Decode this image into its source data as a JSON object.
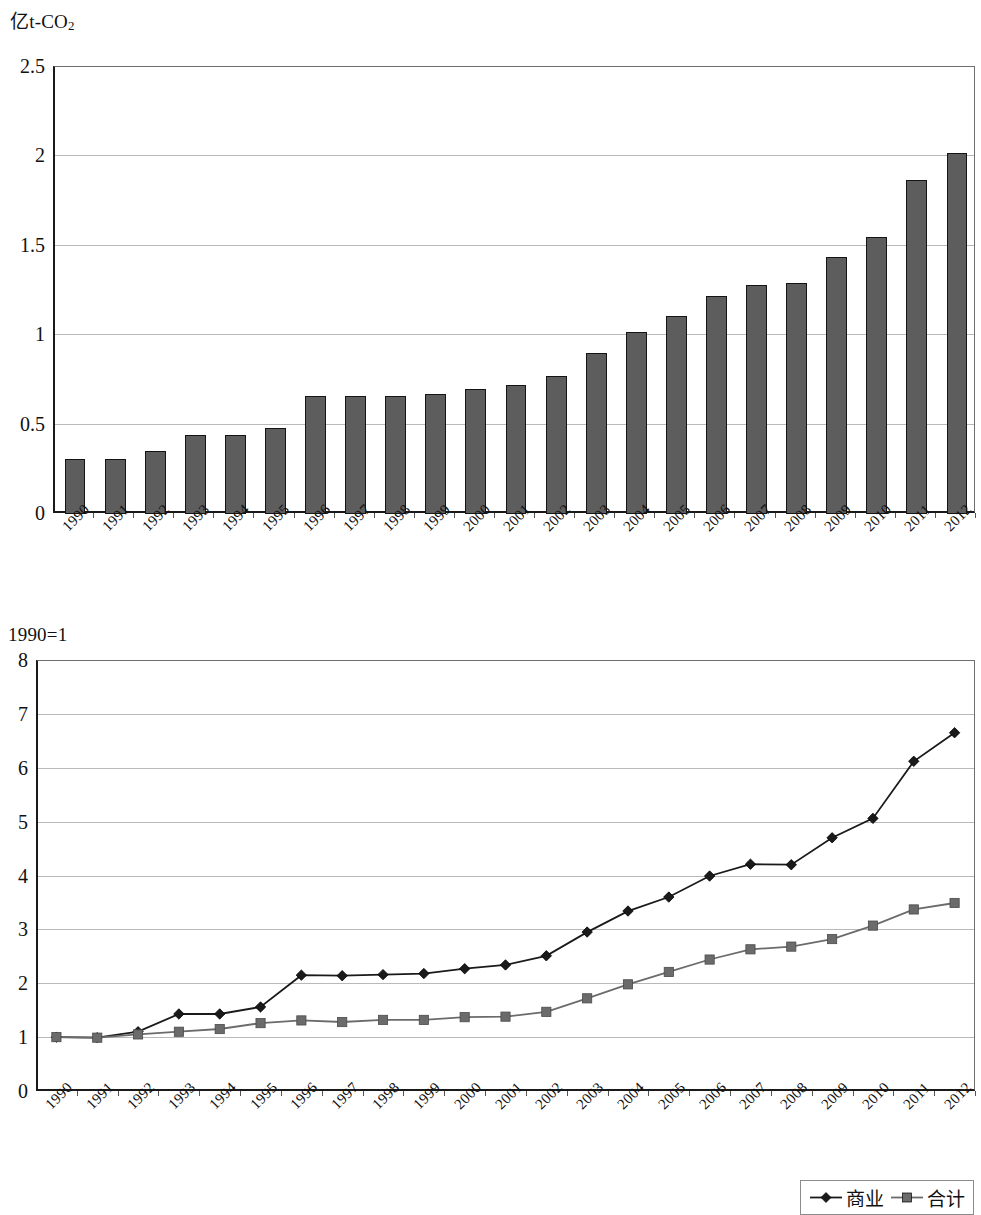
{
  "figure": {
    "chart1": {
      "unit_label_main": "亿t-CO",
      "unit_label_sub": "2",
      "y_ticks": [
        "0",
        "0.5",
        "1",
        "1.5",
        "2",
        "2.5"
      ],
      "x_ticks": [
        "1990",
        "1991",
        "1992",
        "1993",
        "1994",
        "1995",
        "1996",
        "1997",
        "1998",
        "1999",
        "2000",
        "2001",
        "2002",
        "2003",
        "2004",
        "2005",
        "2006",
        "2007",
        "2008",
        "2009",
        "2010",
        "2011",
        "2012"
      ]
    },
    "chart2": {
      "unit_label_main": "1990=1",
      "y_ticks": [
        "0",
        "1",
        "2",
        "3",
        "4",
        "5",
        "6",
        "7",
        "8"
      ],
      "x_ticks": [
        "1990",
        "1991",
        "1992",
        "1993",
        "1994",
        "1995",
        "1996",
        "1997",
        "1998",
        "1999",
        "2000",
        "2001",
        "2002",
        "2003",
        "2004",
        "2005",
        "2006",
        "2007",
        "2008",
        "2009",
        "2010",
        "2011",
        "2012"
      ],
      "legend": [
        {
          "label": "商业",
          "marker": "diamond",
          "color": "#1a1a1a"
        },
        {
          "label": "合计",
          "marker": "square",
          "color": "#6b6b6b"
        }
      ]
    }
  },
  "chart_data": [
    {
      "type": "bar",
      "title": "",
      "xlabel": "",
      "ylabel": "亿t-CO2",
      "ylim": [
        0,
        2.5
      ],
      "ytick_values": [
        0,
        0.5,
        1,
        1.5,
        2,
        2.5
      ],
      "grid": true,
      "legend_position": "none",
      "bar_color": "#5d5d5d",
      "categories": [
        "1990",
        "1991",
        "1992",
        "1993",
        "1994",
        "1995",
        "1996",
        "1997",
        "1998",
        "1999",
        "2000",
        "2001",
        "2002",
        "2003",
        "2004",
        "2005",
        "2006",
        "2007",
        "2008",
        "2009",
        "2010",
        "2011",
        "2012"
      ],
      "values": [
        0.31,
        0.31,
        0.35,
        0.44,
        0.44,
        0.48,
        0.66,
        0.66,
        0.66,
        0.67,
        0.7,
        0.72,
        0.77,
        0.9,
        1.02,
        1.11,
        1.22,
        1.28,
        1.29,
        1.44,
        1.55,
        1.87,
        2.02
      ]
    },
    {
      "type": "line",
      "title": "",
      "xlabel": "",
      "ylabel": "1990=1",
      "ylim": [
        0,
        8
      ],
      "ytick_values": [
        0,
        1,
        2,
        3,
        4,
        5,
        6,
        7,
        8
      ],
      "grid": true,
      "legend_position": "bottom-right",
      "x": [
        "1990",
        "1991",
        "1992",
        "1993",
        "1994",
        "1995",
        "1996",
        "1997",
        "1998",
        "1999",
        "2000",
        "2001",
        "2002",
        "2003",
        "2004",
        "2005",
        "2006",
        "2007",
        "2008",
        "2009",
        "2010",
        "2011",
        "2012"
      ],
      "series": [
        {
          "name": "商业",
          "marker": "diamond",
          "color": "#1a1a1a",
          "values": [
            1.0,
            0.99,
            1.1,
            1.43,
            1.43,
            1.56,
            2.15,
            2.14,
            2.16,
            2.18,
            2.27,
            2.34,
            2.51,
            2.95,
            3.34,
            3.6,
            3.99,
            4.21,
            4.2,
            4.7,
            5.06,
            6.12,
            6.65
          ]
        },
        {
          "name": "合计",
          "marker": "square",
          "color": "#6b6b6b",
          "values": [
            1.0,
            0.99,
            1.05,
            1.1,
            1.15,
            1.26,
            1.31,
            1.28,
            1.32,
            1.32,
            1.37,
            1.38,
            1.47,
            1.72,
            1.98,
            2.21,
            2.44,
            2.63,
            2.68,
            2.82,
            3.07,
            3.37,
            3.49
          ]
        }
      ]
    }
  ]
}
